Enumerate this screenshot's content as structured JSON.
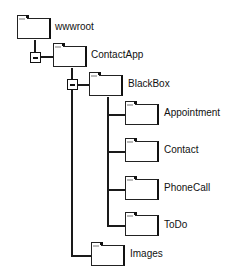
{
  "tree": {
    "nodes": [
      {
        "id": "wwwroot",
        "label": "wwwroot",
        "icon": "folder-icon",
        "expanded": true
      },
      {
        "id": "contactapp",
        "label": "ContactApp",
        "icon": "folder-icon",
        "expanded": true
      },
      {
        "id": "blackbox",
        "label": "BlackBox",
        "icon": "folder-icon"
      },
      {
        "id": "appointment",
        "label": "Appointment",
        "icon": "folder-icon"
      },
      {
        "id": "contact",
        "label": "Contact",
        "icon": "folder-icon"
      },
      {
        "id": "phonecall",
        "label": "PhoneCall",
        "icon": "folder-icon"
      },
      {
        "id": "todo",
        "label": "ToDo",
        "icon": "folder-icon"
      },
      {
        "id": "images",
        "label": "Images",
        "icon": "folder-icon"
      }
    ],
    "toggles": [
      {
        "node": "wwwroot",
        "state": "collapse",
        "icon": "minus-icon"
      },
      {
        "node": "contactapp",
        "state": "collapse",
        "icon": "minus-icon"
      }
    ]
  }
}
